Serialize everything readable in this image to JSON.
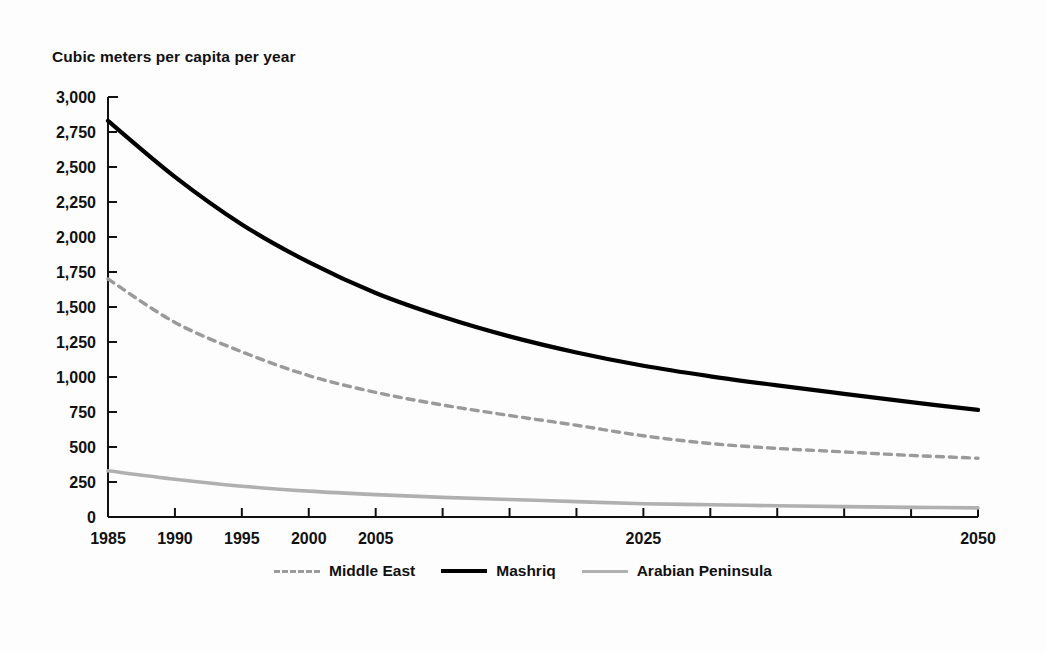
{
  "chart_data": {
    "type": "line",
    "title": "",
    "ylabel": "Cubic meters per capita per year",
    "xlabel": "",
    "ylim": [
      0,
      3000
    ],
    "xlim": [
      1985,
      2050
    ],
    "grid": false,
    "legend_position": "bottom",
    "ytick_labels": [
      "3,000",
      "2,750",
      "2,500",
      "2,250",
      "2,000",
      "1,750",
      "1,500",
      "1,250",
      "1,000",
      "750",
      "500",
      "250",
      "0"
    ],
    "ytick_values": [
      3000,
      2750,
      2500,
      2250,
      2000,
      1750,
      1500,
      1250,
      1000,
      750,
      500,
      250,
      0
    ],
    "xtick_values": [
      1985,
      1990,
      1995,
      2000,
      2005,
      2010,
      2015,
      2020,
      2025,
      2030,
      2035,
      2040,
      2045,
      2050
    ],
    "xtick_labels": [
      "1985",
      "1990",
      "1995",
      "2000",
      "2005",
      "",
      "",
      "",
      "2025",
      "",
      "",
      "",
      "",
      "2050"
    ],
    "x": [
      1985,
      1990,
      1995,
      2000,
      2005,
      2010,
      2015,
      2020,
      2025,
      2030,
      2035,
      2040,
      2045,
      2050
    ],
    "series": [
      {
        "name": "Middle East",
        "style": "dashed",
        "color": "#9a9a9a",
        "values": [
          1700,
          1390,
          1180,
          1010,
          890,
          800,
          725,
          655,
          580,
          525,
          490,
          465,
          440,
          420
        ]
      },
      {
        "name": "Mashriq",
        "style": "solid",
        "color": "#000000",
        "values": [
          2830,
          2430,
          2090,
          1820,
          1600,
          1430,
          1290,
          1175,
          1080,
          1005,
          940,
          880,
          820,
          765
        ]
      },
      {
        "name": "Arabian Peninsula",
        "style": "solid",
        "color": "#b0b0b0",
        "values": [
          330,
          270,
          220,
          185,
          160,
          140,
          125,
          110,
          95,
          88,
          80,
          74,
          69,
          65
        ]
      }
    ]
  },
  "legend": {
    "items": [
      {
        "label": "Middle East",
        "swatch": "dashed-gray-line"
      },
      {
        "label": "Mashriq",
        "swatch": "solid-black-line"
      },
      {
        "label": "Arabian Peninsula",
        "swatch": "solid-gray-line"
      }
    ]
  },
  "source": {
    "text": ""
  }
}
